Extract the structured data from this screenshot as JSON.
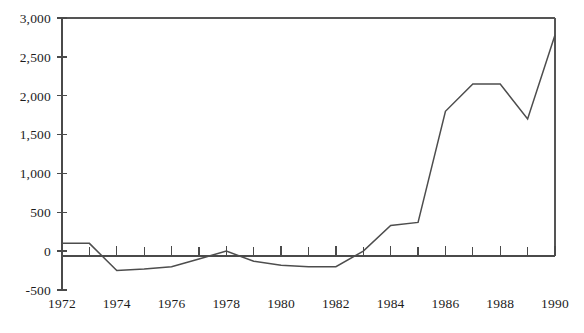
{
  "chart_data": {
    "type": "line",
    "title": "",
    "subtitle": "",
    "xlabel": "",
    "ylabel": "",
    "xlim": [
      1972,
      1990
    ],
    "ylim": [
      -500,
      3000
    ],
    "grid": false,
    "legend": null,
    "y_ticks": [
      3000,
      2500,
      2000,
      1500,
      1000,
      500,
      0,
      -500
    ],
    "y_tick_labels": [
      "3,000",
      "2,500",
      "2,000",
      "1,500",
      "1,000",
      "500",
      "0",
      "-500"
    ],
    "x_ticks": [
      1972,
      1973,
      1974,
      1975,
      1976,
      1977,
      1978,
      1979,
      1980,
      1981,
      1982,
      1983,
      1984,
      1985,
      1986,
      1987,
      1988,
      1989,
      1990
    ],
    "x_tick_labels_shown": [
      "1972",
      "1974",
      "1976",
      "1978",
      "1980",
      "1982",
      "1984",
      "1986",
      "1988",
      "1990"
    ],
    "x_label_interval": 2,
    "x": [
      1972,
      1973,
      1974,
      1975,
      1976,
      1977,
      1978,
      1979,
      1980,
      1981,
      1982,
      1983,
      1984,
      1985,
      1986,
      1987,
      1988,
      1989,
      1990
    ],
    "values": [
      100,
      100,
      -250,
      -230,
      -200,
      -100,
      0,
      -130,
      -180,
      -200,
      -200,
      0,
      330,
      370,
      1800,
      2150,
      2150,
      1700,
      2780
    ],
    "series": [
      {
        "name": "series-1",
        "values": [
          100,
          100,
          -250,
          -230,
          -200,
          -100,
          0,
          -130,
          -180,
          -200,
          -200,
          0,
          330,
          370,
          1800,
          2150,
          2150,
          1700,
          2780
        ]
      }
    ],
    "colors": {
      "line": "#4d4d4d",
      "axis": "#4a4a4a",
      "frame": "#555555",
      "text": "#1c1c1c",
      "background": "#ffffff"
    }
  }
}
